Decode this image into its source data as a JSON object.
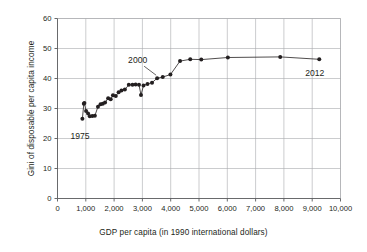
{
  "chart_data": {
    "type": "line",
    "title": "",
    "subtitle": "",
    "xlabel": "GDP per capita (in 1990 international dollars)",
    "ylabel": "Gini of disposable per capita income",
    "xlim": [
      0,
      10000
    ],
    "ylim": [
      0,
      60
    ],
    "xticks": [
      0,
      1000,
      2000,
      3000,
      4000,
      5000,
      6000,
      7000,
      8000,
      9000,
      10000
    ],
    "xtick_labels": [
      "0",
      "1,000",
      "2,000",
      "3,000",
      "4,000",
      "5,000",
      "6,000",
      "7,000",
      "8,000",
      "9,000",
      "10,000"
    ],
    "yticks": [
      0,
      10,
      20,
      30,
      40,
      50,
      60
    ],
    "ytick_labels": [
      "0",
      "10",
      "20",
      "30",
      "40",
      "50",
      "60"
    ],
    "grid": true,
    "grid_color": "#a7a9ac",
    "legend": null,
    "marker": "filled-circle",
    "marker_color": "#231f20",
    "line_color": "#231f20",
    "series": [
      {
        "name": "Gini of disposable per capita income vs GDP per capita",
        "points": [
          {
            "x": 880,
            "y": 26.6
          },
          {
            "x": 930,
            "y": 31.6
          },
          {
            "x": 950,
            "y": 31.8
          },
          {
            "x": 1010,
            "y": 29.2
          },
          {
            "x": 1080,
            "y": 28.3
          },
          {
            "x": 1140,
            "y": 27.4
          },
          {
            "x": 1230,
            "y": 27.5
          },
          {
            "x": 1320,
            "y": 27.6
          },
          {
            "x": 1430,
            "y": 30.6
          },
          {
            "x": 1520,
            "y": 31.4
          },
          {
            "x": 1600,
            "y": 31.6
          },
          {
            "x": 1680,
            "y": 32.0
          },
          {
            "x": 1790,
            "y": 33.4
          },
          {
            "x": 1880,
            "y": 33.1
          },
          {
            "x": 1960,
            "y": 34.4
          },
          {
            "x": 2060,
            "y": 34.2
          },
          {
            "x": 2160,
            "y": 35.4
          },
          {
            "x": 2260,
            "y": 36.0
          },
          {
            "x": 2380,
            "y": 36.3
          },
          {
            "x": 2520,
            "y": 37.9
          },
          {
            "x": 2650,
            "y": 37.9
          },
          {
            "x": 2760,
            "y": 38.0
          },
          {
            "x": 2880,
            "y": 37.9
          },
          {
            "x": 2950,
            "y": 34.5
          },
          {
            "x": 3040,
            "y": 37.7
          },
          {
            "x": 3180,
            "y": 38.2
          },
          {
            "x": 3340,
            "y": 38.6
          },
          {
            "x": 3520,
            "y": 40.1
          },
          {
            "x": 3720,
            "y": 40.5
          },
          {
            "x": 3990,
            "y": 41.3
          },
          {
            "x": 4330,
            "y": 45.8
          },
          {
            "x": 4690,
            "y": 46.4
          },
          {
            "x": 5080,
            "y": 46.3
          },
          {
            "x": 6020,
            "y": 47.0
          },
          {
            "x": 7870,
            "y": 47.2
          },
          {
            "x": 9250,
            "y": 46.4
          }
        ]
      }
    ],
    "annotations": [
      {
        "label": "1975",
        "target_x": 880,
        "target_y": 26.6,
        "position": "below-left",
        "leader": false
      },
      {
        "label": "2000",
        "target_x": 3520,
        "target_y": 40.1,
        "position": "above-left",
        "leader": true
      },
      {
        "label": "2012",
        "target_x": 9250,
        "target_y": 46.4,
        "position": "below-right",
        "leader": false
      }
    ]
  },
  "colors": {
    "ink": "#231f20",
    "grid": "#a7a9ac",
    "axis": "#58595b",
    "background": "#ffffff"
  }
}
